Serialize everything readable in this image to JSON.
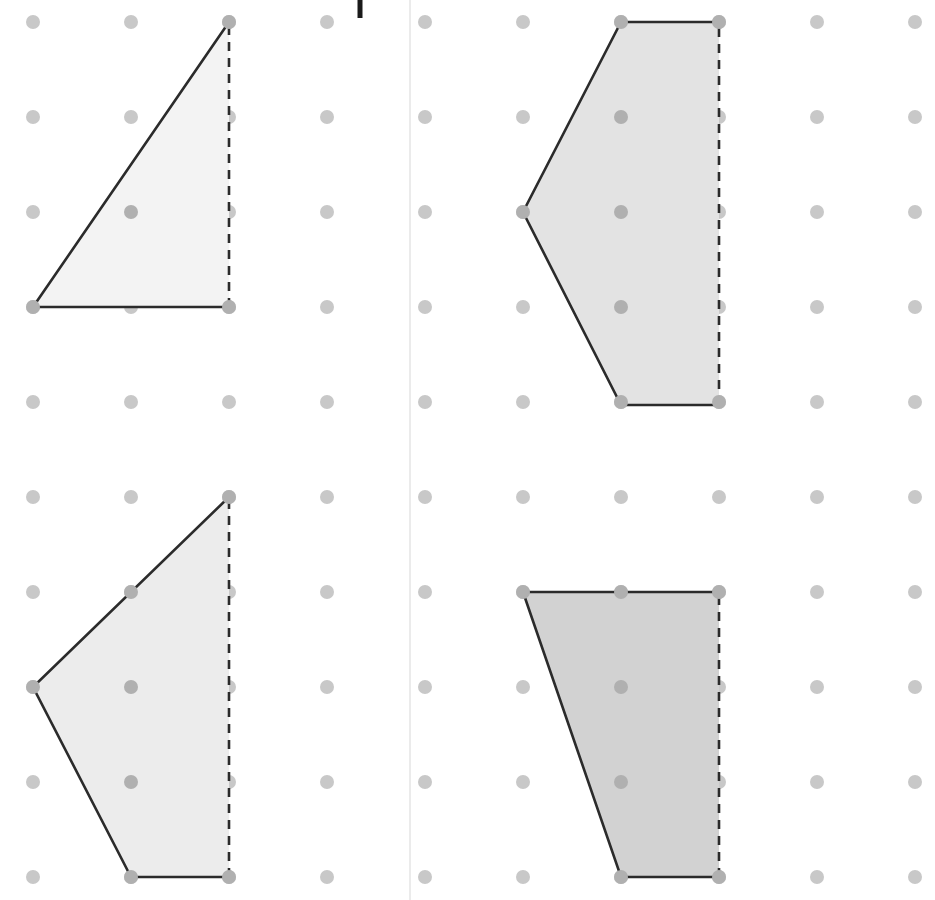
{
  "page": {
    "background_color": "#ffffff",
    "width": 935,
    "height": 900
  },
  "grid": {
    "name": "dot-grid",
    "dot_color": "#c8c8c8",
    "dot_color_inside_shape": "#b0b0b0",
    "dot_radius": 7,
    "columns_x": [
      33,
      131,
      229,
      327,
      425,
      523,
      621,
      719,
      817,
      915
    ],
    "rows_y": [
      22,
      117,
      212,
      307,
      402,
      497,
      592,
      687,
      782,
      877
    ],
    "column_spacing": 98,
    "row_spacing": 95
  },
  "marks": {
    "panel_divider": {
      "name": "vertical-panel-divider",
      "x": 410,
      "y1": 0,
      "y2": 900,
      "color": "#ebebeb",
      "width": 2
    },
    "top_tick": {
      "name": "top-crop-tick",
      "x": 360,
      "y1": 0,
      "y2": 18,
      "color": "#1a1a1a",
      "width": 5
    }
  },
  "shapes": [
    {
      "id": "shape-top-left",
      "name": "triangle-top-left",
      "label": "Top-left right triangle",
      "kind": "triangle",
      "vertex_count": 3,
      "fill": "#f3f3f3",
      "stroke": "#2b2b2b",
      "stroke_width": 2.6,
      "points": "33,307 229,22 229,307",
      "solid_path": "M 229,22 L 33,307 L 229,307",
      "dashed_path": "M 229,307 L 229,22",
      "dash_pattern": "9,7",
      "vertices": [
        [
          33,
          307
        ],
        [
          229,
          22
        ],
        [
          229,
          307
        ]
      ]
    },
    {
      "id": "shape-top-right",
      "name": "pentagon-top-right",
      "label": "Top-right pentagon",
      "kind": "pentagon",
      "vertex_count": 5,
      "fill": "#e3e3e3",
      "stroke": "#2b2b2b",
      "stroke_width": 2.6,
      "points": "621,22 719,22 719,405 621,405 523,212",
      "solid_path": "M 719,22 L 621,22 L 523,212 L 621,405 L 719,405",
      "dashed_path": "M 719,405 L 719,22",
      "dash_pattern": "9,7",
      "vertices": [
        [
          621,
          22
        ],
        [
          719,
          22
        ],
        [
          719,
          405
        ],
        [
          621,
          405
        ],
        [
          523,
          212
        ]
      ]
    },
    {
      "id": "shape-bottom-left",
      "name": "quadrilateral-bottom-left",
      "label": "Bottom-left quadrilateral",
      "kind": "quadrilateral",
      "vertex_count": 4,
      "fill": "#ececec",
      "stroke": "#2b2b2b",
      "stroke_width": 2.6,
      "points": "229,497 33,687 131,877 229,877",
      "solid_path": "M 229,497 L 33,687 L 131,877 L 229,877",
      "dashed_path": "M 229,877 L 229,497",
      "dash_pattern": "9,7",
      "vertices": [
        [
          229,
          497
        ],
        [
          33,
          687
        ],
        [
          131,
          877
        ],
        [
          229,
          877
        ]
      ]
    },
    {
      "id": "shape-bottom-right",
      "name": "trapezoid-bottom-right",
      "label": "Bottom-right trapezoid",
      "kind": "trapezoid",
      "vertex_count": 4,
      "fill": "#d2d2d2",
      "stroke": "#2b2b2b",
      "stroke_width": 2.6,
      "points": "523,592 719,592 719,877 621,877",
      "solid_path": "M 719,592 L 523,592 L 621,877 L 719,877",
      "dashed_path": "M 719,877 L 719,592",
      "dash_pattern": "9,7",
      "vertices": [
        [
          523,
          592
        ],
        [
          719,
          592
        ],
        [
          719,
          877
        ],
        [
          621,
          877
        ]
      ]
    }
  ]
}
